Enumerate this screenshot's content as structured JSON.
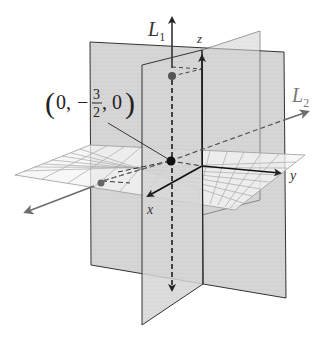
{
  "diagram": {
    "labels": {
      "line1": "L",
      "line1_sub": "1",
      "line2": "L",
      "line2_sub": "2",
      "z_axis": "z",
      "y_axis": "y",
      "x_axis": "x"
    },
    "point_label": {
      "open": "(",
      "first": "0,",
      "minus": "−",
      "num": "3",
      "den": "2",
      "rest": ", 0",
      "close": ")"
    },
    "colors": {
      "plane_fill": "#d4d4d4",
      "plane_edge": "#333333",
      "grid_line": "#9a9a9a",
      "grid_fill": "#f4f4f4",
      "axis": "#111111",
      "line_L1": "#3a3a3a",
      "line_L2": "#6e6e6e"
    }
  }
}
